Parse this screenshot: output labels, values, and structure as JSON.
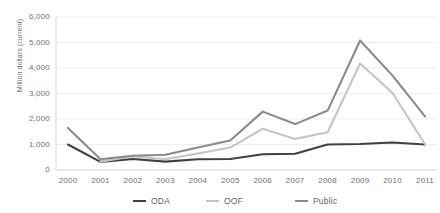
{
  "chart_data": {
    "type": "line",
    "title": "",
    "xlabel": "",
    "ylabel": "Million dollars (current)",
    "categories": [
      "2000",
      "2001",
      "2002",
      "2003",
      "2004",
      "2005",
      "2006",
      "2007",
      "2008",
      "2009",
      "2010",
      "2011"
    ],
    "ylim": [
      0,
      6000
    ],
    "ytick_labels": [
      "0",
      "1,000",
      "2,000",
      "3,000",
      "4,000",
      "5,000",
      "6,000"
    ],
    "ytick_values": [
      0,
      1000,
      2000,
      3000,
      4000,
      5000,
      6000
    ],
    "grid": "horizontal",
    "legend_position": "bottom",
    "series": [
      {
        "name": "ODA",
        "color": "#404040",
        "values": [
          1000,
          320,
          430,
          330,
          420,
          430,
          620,
          640,
          1000,
          1020,
          1080,
          1000
        ]
      },
      {
        "name": "OOF",
        "color": "#c4c4c4",
        "values": [
          null,
          330,
          540,
          420,
          650,
          880,
          1620,
          1220,
          1480,
          4180,
          3020,
          1010
        ]
      },
      {
        "name": "Public",
        "color": "#8a8a8a",
        "values": [
          1650,
          420,
          560,
          600,
          880,
          1160,
          2290,
          1800,
          2330,
          5080,
          3700,
          2100
        ]
      }
    ]
  },
  "legend": {
    "items": [
      {
        "label": "ODA",
        "color": "#404040"
      },
      {
        "label": "OOF",
        "color": "#c4c4c4"
      },
      {
        "label": "Public",
        "color": "#8a8a8a"
      }
    ]
  }
}
